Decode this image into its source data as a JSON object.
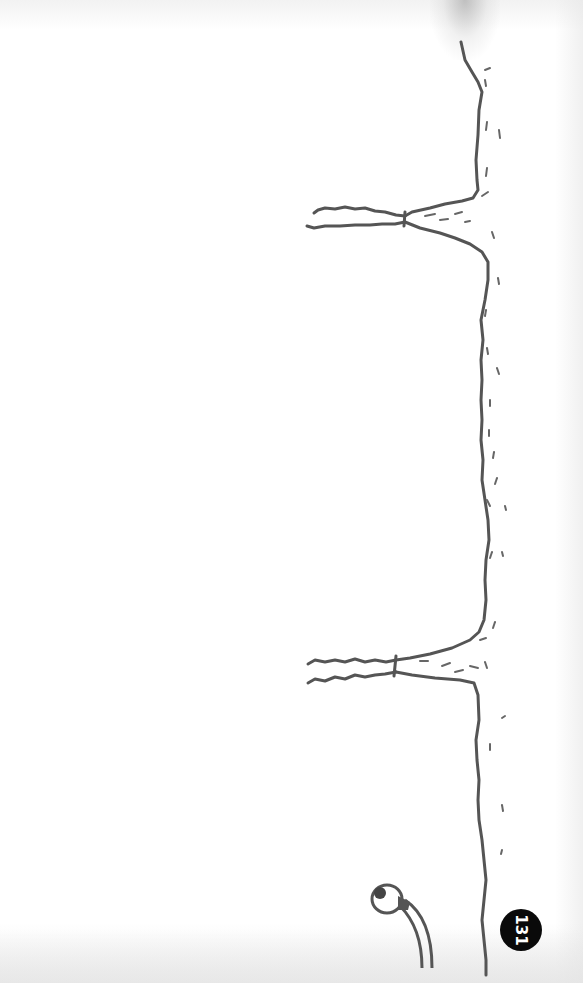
{
  "page": {
    "type": "illustrated book page (rotated)",
    "page_number": "131",
    "colors": {
      "ink": "#555555",
      "paper": "#ffffff",
      "badge": "#0a0a0a",
      "badge_text": "#ffffff"
    }
  },
  "illustration": {
    "elements": [
      {
        "name": "wall-line",
        "description": "wavy vertical line running top to bottom near right side"
      },
      {
        "name": "upper-arm",
        "description": "horizontal wavy branch extending left at y~215"
      },
      {
        "name": "lower-arm",
        "description": "horizontal wavy branch extending left at y~670"
      },
      {
        "name": "eyeball-creature",
        "description": "eyeball on a long curved stalk at bottom"
      }
    ]
  }
}
